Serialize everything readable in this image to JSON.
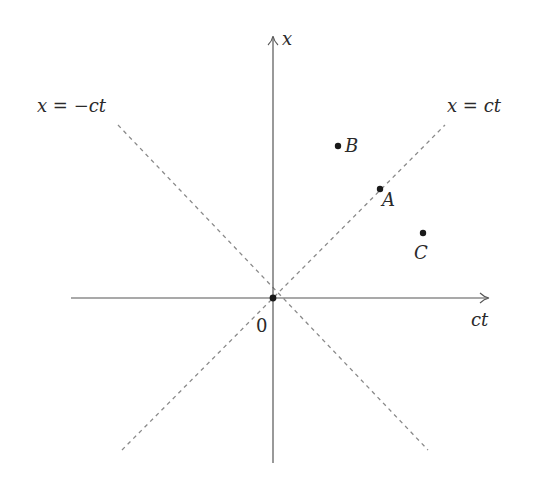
{
  "diagram": {
    "type": "spacetime-diagram",
    "axes": {
      "horizontal_label": "ct",
      "vertical_label": "x",
      "origin_label": "0"
    },
    "light_lines": [
      {
        "label": "x = ct",
        "slope": 1
      },
      {
        "label": "x = −ct",
        "slope": -1
      }
    ],
    "events": [
      {
        "label": "B",
        "x": 338,
        "y": 146
      },
      {
        "label": "A",
        "x": 380,
        "y": 189
      },
      {
        "label": "C",
        "x": 423,
        "y": 233
      }
    ],
    "colors": {
      "axis": "#555555",
      "dashed": "#888888",
      "point": "#1a1a1a",
      "text": "#2a2a2a"
    }
  }
}
